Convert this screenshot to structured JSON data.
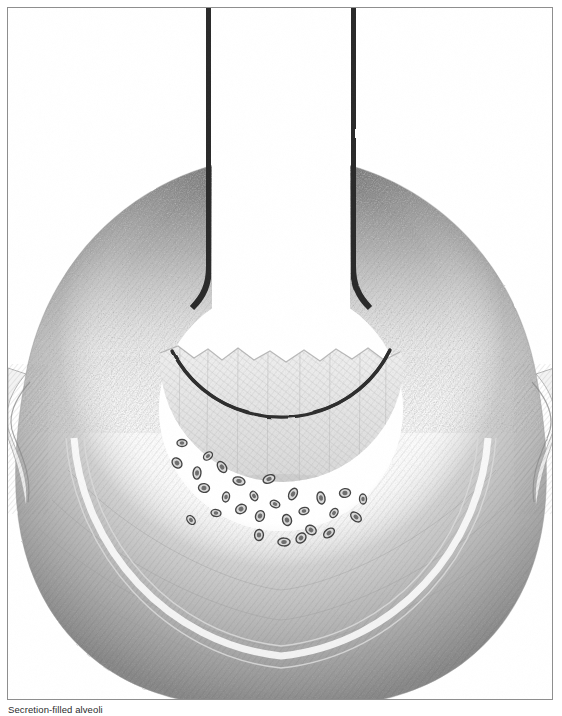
{
  "figure": {
    "caption": "Secretion-filled alveoli",
    "medium": "graphite pencil drawing",
    "orientation": "vertical, bilaterally symmetric about the vertical midline"
  },
  "frame": {
    "border_color": "#8e8e8e",
    "border_width_px": 1,
    "background": "#ffffff",
    "x": 7,
    "y": 7,
    "width": 546,
    "height": 693
  },
  "palette": {
    "paper_white": "#ffffff",
    "light_hatch": "#ededed",
    "mid_hatch": "#d2d2d2",
    "mid_shade": "#a8a8a8",
    "dark_stipple": "#6e6e6e",
    "deep_stipple": "#4a4a4a",
    "outline_dark": "#2d2d2d",
    "airway_wall": "#2a2a2a",
    "cell_fill": "#5a5a5a",
    "cell_outline": "#3a3a3a",
    "caption_text": "#2b2b2b"
  },
  "anatomy": {
    "airway": {
      "label": "bronchiole lumen",
      "left_wall_x": 211,
      "right_wall_x": 351,
      "wall_thickness_px": 6,
      "top_y": 10,
      "bottom_y": 280,
      "lumen_fill": "#ffffff"
    },
    "alveolar_sac": {
      "label": "terminal alveolar sac",
      "center_x": 281,
      "center_y": 408,
      "radius_px": 122,
      "outline_color": "#2d2d2d",
      "lumen_fill": "#ffffff"
    },
    "secretion": {
      "label": "secretion fluid level",
      "surface_y": 352,
      "surface_profile": "irregular jagged meniscus",
      "fill_tone": "#e4e4e4",
      "hatch_direction": "diagonal, lower-left to upper-right"
    },
    "wall_torus": {
      "label": "alveolar wall / surrounding septa",
      "outer_radius_px": 250,
      "inner_radius_px": 130,
      "shading": "dark stipple at superior aspect grading to light hatch inferiorly"
    },
    "lateral_alveoli": [
      {
        "side": "left",
        "label": "adjacent alveolus",
        "center_x": 30,
        "center_y": 430
      },
      {
        "side": "right",
        "label": "adjacent alveolus",
        "center_x": 532,
        "center_y": 430
      }
    ],
    "inflammatory_cells": {
      "label": "inflammatory cells in secretion",
      "count": 28,
      "shape": "small ovals with darker nuclei",
      "distribution": "clustered along inferior inner curvature of the sac",
      "points": [
        [
          181,
          442
        ],
        [
          176,
          462
        ],
        [
          196,
          472
        ],
        [
          207,
          455
        ],
        [
          203,
          487
        ],
        [
          221,
          466
        ],
        [
          225,
          496
        ],
        [
          240,
          508
        ],
        [
          238,
          480
        ],
        [
          253,
          495
        ],
        [
          259,
          515
        ],
        [
          268,
          478
        ],
        [
          274,
          503
        ],
        [
          286,
          519
        ],
        [
          292,
          493
        ],
        [
          303,
          510
        ],
        [
          310,
          529
        ],
        [
          320,
          497
        ],
        [
          333,
          512
        ],
        [
          344,
          492
        ],
        [
          355,
          516
        ],
        [
          362,
          498
        ],
        [
          300,
          537
        ],
        [
          283,
          541
        ],
        [
          190,
          519
        ],
        [
          258,
          534
        ],
        [
          328,
          532
        ],
        [
          215,
          512
        ]
      ]
    }
  }
}
